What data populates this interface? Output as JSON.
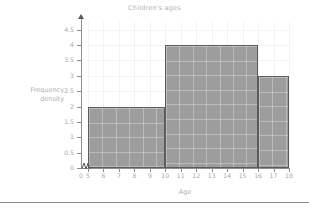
{
  "chart_data": {
    "type": "bar",
    "title": "Children's ages",
    "xlabel": "Age",
    "ylabel": "Frequency density",
    "ylabel_lines": [
      "Frequency",
      "density"
    ],
    "grid": true,
    "legend": "none",
    "xlim": [
      5,
      18
    ],
    "ylim": [
      0,
      4.75
    ],
    "x_axis_break": true,
    "x_break_from": 0,
    "x_break_to": 5,
    "x_ticks": [
      0,
      5,
      6,
      7,
      8,
      9,
      10,
      11,
      12,
      13,
      14,
      15,
      16,
      17,
      18
    ],
    "y_ticks": [
      0,
      0.5,
      1,
      1.5,
      2,
      2.5,
      3,
      3.5,
      4,
      4.5
    ],
    "y_tick_labels": [
      "0",
      "0.5",
      "1",
      "1.5",
      "2",
      "2.5",
      "3",
      "3.5",
      "4",
      "4.5"
    ],
    "bins": [
      {
        "label": "5-10",
        "start": 5,
        "end": 10,
        "value": 2
      },
      {
        "label": "10-16",
        "start": 10,
        "end": 16,
        "value": 4
      },
      {
        "label": "16-18",
        "start": 16,
        "end": 18,
        "value": 3
      }
    ],
    "categories": [
      "5-10",
      "10-16",
      "16-18"
    ],
    "values": [
      2,
      4,
      3
    ],
    "colors": {
      "bar_fill": "#9d9d9d",
      "bar_border": "#5c5c5c",
      "axis": "#8d8d8d",
      "grid": "#f2f2f2",
      "text": "#a8a8a8",
      "title_text": "#b3b3b3",
      "background": "#ffffff",
      "rule": "#8e8e8e"
    }
  }
}
